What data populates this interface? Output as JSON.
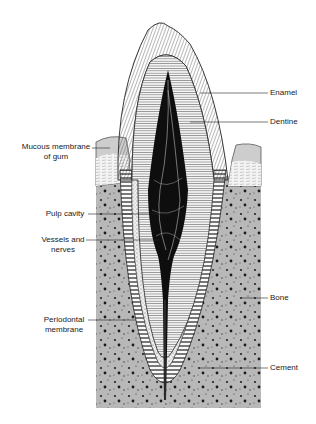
{
  "diagram": {
    "colors": {
      "background": "#ffffff",
      "bone": "#b5b5b5",
      "gum": "#cfcfcf",
      "pulp": "#111111",
      "line": "#222222",
      "dentine_fill": "#f2f2f2",
      "cement_fill": "#e8e8e8"
    },
    "labels": {
      "enamel": "Enamel",
      "dentine": "Dentine",
      "mucous_line1": "Mucous membrane",
      "mucous_line2": "of gum",
      "pulp_cavity": "Pulp cavity",
      "vessels_line1": "Vessels and",
      "vessels_line2": "nerves",
      "bone": "Bone",
      "periodontal_line1": "Periodontal",
      "periodontal_line2": "membrane",
      "cement": "Cement"
    }
  }
}
